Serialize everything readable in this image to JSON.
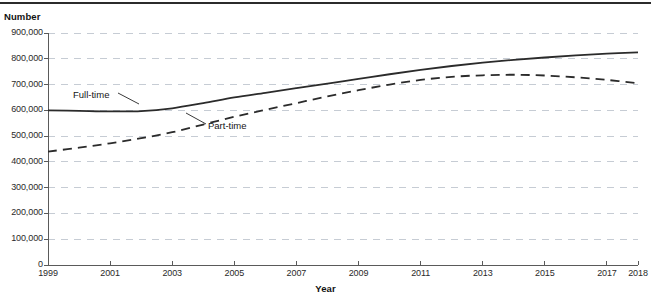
{
  "chart_data": {
    "type": "line",
    "title": "",
    "xlabel": "Year",
    "ylabel": "Number",
    "xlim": [
      1999,
      2018
    ],
    "ylim": [
      0,
      900000
    ],
    "grid": true,
    "legend_position": "inline-annotations",
    "x": [
      1999,
      2000,
      2001,
      2002,
      2003,
      2004,
      2005,
      2006,
      2007,
      2008,
      2009,
      2010,
      2011,
      2012,
      2013,
      2014,
      2015,
      2016,
      2017,
      2018
    ],
    "ytick_labels": [
      "0",
      "100,000",
      "200,000",
      "300,000",
      "400,000",
      "500,000",
      "600,000",
      "700,000",
      "800,000",
      "900,000"
    ],
    "ytick_values": [
      0,
      100000,
      200000,
      300000,
      400000,
      500000,
      600000,
      700000,
      800000,
      900000
    ],
    "xtick_labels": [
      "1999",
      "2001",
      "2003",
      "2005",
      "2007",
      "2009",
      "2011",
      "2013",
      "2015",
      "2017",
      "2018"
    ],
    "xtick_values": [
      1999,
      2001,
      2003,
      2005,
      2007,
      2009,
      2011,
      2013,
      2015,
      2017,
      2018
    ],
    "series": [
      {
        "name": "Full-time",
        "style": "solid",
        "color": "#2b2b2b",
        "values": [
          600000,
          598000,
          596000,
          597000,
          608000,
          628000,
          650000,
          668000,
          686000,
          704000,
          722000,
          740000,
          757000,
          772000,
          785000,
          796000,
          805000,
          813000,
          820000,
          825000
        ]
      },
      {
        "name": "Part-time",
        "style": "dashed",
        "color": "#2b2b2b",
        "values": [
          440000,
          455000,
          472000,
          492000,
          515000,
          545000,
          575000,
          602000,
          628000,
          654000,
          678000,
          700000,
          718000,
          730000,
          736000,
          738000,
          735000,
          728000,
          718000,
          705000
        ]
      }
    ],
    "annotations": [
      {
        "text": "Full-time",
        "label_x": 73,
        "label_y": 89,
        "leader_from_x": 118,
        "leader_from_y": 93,
        "leader_to_x": 139,
        "leader_to_y": 104
      },
      {
        "text": "Part-time",
        "label_x": 208,
        "label_y": 120,
        "leader_from_x": 206,
        "leader_from_y": 124,
        "leader_to_x": 186,
        "leader_to_y": 113
      }
    ]
  }
}
